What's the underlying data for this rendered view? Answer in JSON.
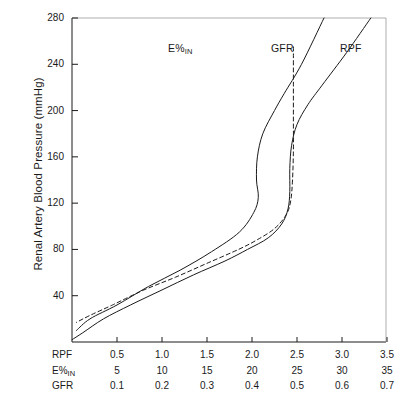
{
  "chart_data": {
    "type": "line",
    "title": "",
    "ylabel": "Renal Artery Blood Pressure (mmHg)",
    "xlabel": "",
    "ylim": [
      0,
      280
    ],
    "yticks": [
      40,
      80,
      120,
      160,
      200,
      240,
      280
    ],
    "grid": false,
    "legend_position": "inline-top",
    "x_axes": [
      {
        "name": "RPF",
        "ticks": [
          "0.5",
          "1.0",
          "1.5",
          "2.0",
          "2.5",
          "3.0",
          "3.5"
        ]
      },
      {
        "name": "E%IN",
        "name_base": "E%",
        "name_sub": "IN",
        "ticks": [
          "5",
          "10",
          "15",
          "20",
          "25",
          "30",
          "35"
        ]
      },
      {
        "name": "GFR",
        "ticks": [
          "0.1",
          "0.2",
          "0.3",
          "0.4",
          "0.5",
          "0.6",
          "0.7"
        ]
      }
    ],
    "series": [
      {
        "name": "E%IN",
        "label_base": "E%",
        "label_sub": "IN",
        "style": "solid",
        "color": "#1a1a1a",
        "axis": "E%IN",
        "description": "Filtration fraction: rises with pressure to a maximum then declines as pressure increases further",
        "points": [
          {
            "x": 2.8,
            "y": 280
          },
          {
            "x": 2.55,
            "y": 240
          },
          {
            "x": 2.36,
            "y": 215
          },
          {
            "x": 2.25,
            "y": 200
          },
          {
            "x": 2.12,
            "y": 180
          },
          {
            "x": 2.06,
            "y": 160
          },
          {
            "x": 2.05,
            "y": 140
          },
          {
            "x": 2.07,
            "y": 125
          },
          {
            "x": 2.02,
            "y": 112
          },
          {
            "x": 1.86,
            "y": 95
          },
          {
            "x": 1.55,
            "y": 78
          },
          {
            "x": 1.2,
            "y": 62
          },
          {
            "x": 0.85,
            "y": 48
          },
          {
            "x": 0.5,
            "y": 32
          },
          {
            "x": 0.2,
            "y": 20
          },
          {
            "x": 0.05,
            "y": 10
          }
        ]
      },
      {
        "name": "GFR",
        "label": "GFR",
        "style": "dashed",
        "color": "#1a1a1a",
        "axis": "GFR",
        "description": "Glomerular filtration rate: autoregulated plateau above roughly 80 mmHg",
        "points": [
          {
            "x": 2.46,
            "y": 255
          },
          {
            "x": 2.46,
            "y": 220
          },
          {
            "x": 2.46,
            "y": 190
          },
          {
            "x": 2.46,
            "y": 165
          },
          {
            "x": 2.45,
            "y": 140
          },
          {
            "x": 2.43,
            "y": 122
          },
          {
            "x": 2.38,
            "y": 110
          },
          {
            "x": 2.25,
            "y": 98
          },
          {
            "x": 2.05,
            "y": 88
          },
          {
            "x": 1.85,
            "y": 80
          },
          {
            "x": 1.5,
            "y": 68
          },
          {
            "x": 1.15,
            "y": 56
          },
          {
            "x": 0.8,
            "y": 45
          },
          {
            "x": 0.45,
            "y": 32
          },
          {
            "x": 0.2,
            "y": 23
          },
          {
            "x": 0.05,
            "y": 17
          }
        ]
      },
      {
        "name": "RPF",
        "label": "RPF",
        "style": "solid",
        "color": "#1a1a1a",
        "axis": "RPF",
        "description": "Renal plasma flow: autoregulated plateau above roughly 80 mmHg, rising again at high pressure",
        "points": [
          {
            "x": 3.32,
            "y": 280
          },
          {
            "x": 3.05,
            "y": 250
          },
          {
            "x": 2.78,
            "y": 222
          },
          {
            "x": 2.62,
            "y": 205
          },
          {
            "x": 2.5,
            "y": 188
          },
          {
            "x": 2.44,
            "y": 170
          },
          {
            "x": 2.42,
            "y": 150
          },
          {
            "x": 2.42,
            "y": 130
          },
          {
            "x": 2.4,
            "y": 115
          },
          {
            "x": 2.33,
            "y": 102
          },
          {
            "x": 2.18,
            "y": 90
          },
          {
            "x": 1.95,
            "y": 80
          },
          {
            "x": 1.7,
            "y": 70
          },
          {
            "x": 1.35,
            "y": 58
          },
          {
            "x": 1.0,
            "y": 45
          },
          {
            "x": 0.65,
            "y": 32
          },
          {
            "x": 0.35,
            "y": 20
          },
          {
            "x": 0.12,
            "y": 8
          },
          {
            "x": 0.0,
            "y": 2
          }
        ]
      }
    ]
  }
}
